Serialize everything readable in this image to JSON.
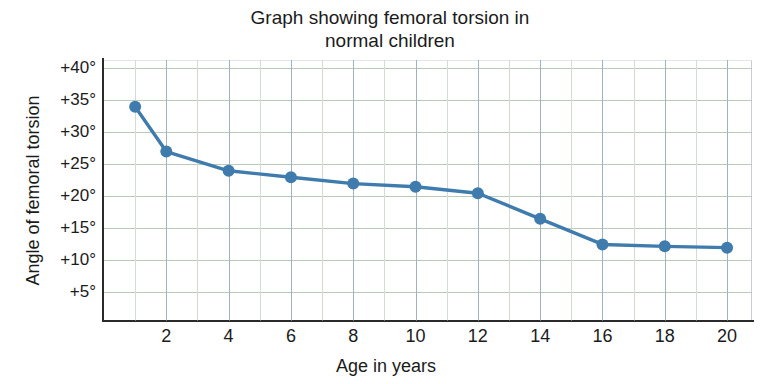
{
  "chart_data": {
    "type": "line",
    "title": "Graph showing femoral torsion in\nnormal children",
    "xlabel": "Age in years",
    "ylabel": "Angle of femoral torsion",
    "x": [
      1,
      2,
      4,
      6,
      8,
      10,
      12,
      14,
      16,
      18,
      20
    ],
    "values": [
      34,
      27,
      24,
      23,
      22,
      21.5,
      20.5,
      16.5,
      12.5,
      12.2,
      12
    ],
    "series": [
      {
        "name": "Angle of femoral torsion",
        "values": [
          34,
          27,
          24,
          23,
          22,
          21.5,
          20.5,
          16.5,
          12.5,
          12.2,
          12
        ]
      }
    ],
    "xlim": [
      0,
      20.8
    ],
    "ylim": [
      0.7,
      41.3
    ],
    "xticks": [
      2,
      4,
      6,
      8,
      10,
      12,
      14,
      16,
      18,
      20
    ],
    "xtick_labels": [
      "2",
      "4",
      "6",
      "8",
      "10",
      "12",
      "14",
      "16",
      "18",
      "20"
    ],
    "yticks": [
      5,
      10,
      15,
      20,
      25,
      30,
      35,
      40
    ],
    "ytick_labels": [
      "+5°",
      "+10°",
      "+15°",
      "+20°",
      "+25°",
      "+30°",
      "+35°",
      "+40°"
    ],
    "x_gridlines": [
      1,
      2,
      3,
      4,
      5,
      6,
      7,
      8,
      9,
      10,
      11,
      12,
      13,
      14,
      15,
      16,
      17,
      18,
      19,
      20
    ],
    "x_gridlines_major": [
      2,
      4,
      6,
      8,
      10,
      12,
      14,
      16,
      18,
      20
    ],
    "grid": true,
    "legend": false,
    "legend_position": "none",
    "colors": {
      "line": "#3f7cad",
      "marker": "#3f7cad",
      "grid_horizontal": "#b7cbb7",
      "grid_vertical": "#d2dcd2",
      "grid_vertical_major": "#9fb3bf",
      "axis": "#2a2a2a",
      "text": "#1b1b1b",
      "background": "#ffffff"
    }
  }
}
